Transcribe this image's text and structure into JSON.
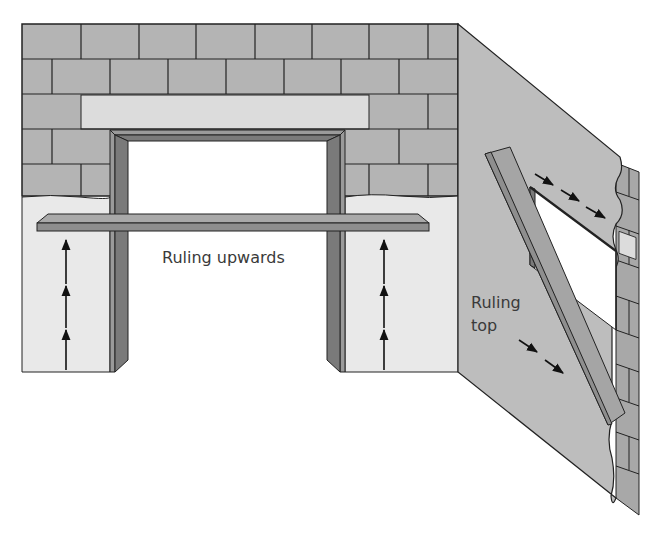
{
  "diagram": {
    "labels": {
      "ruling_upwards": "Ruling upwards",
      "ruling_top_line1": "Ruling",
      "ruling_top_line2": "top"
    },
    "colors": {
      "brick": "#b4b4b4",
      "lintel": "#dcdcdc",
      "plaster": "#e9e9e9",
      "side_wall": "#bdbdbd",
      "frame": "#7a7a7a",
      "ruler_top": "#a9a9a9",
      "ruler_side": "#8e8e8e",
      "outline": "#222222",
      "opening": "#ffffff"
    },
    "elements": [
      {
        "name": "front-wall",
        "description": "Concrete block wall with door opening"
      },
      {
        "name": "side-wall",
        "description": "Plastered wall in perspective with window opening"
      },
      {
        "name": "horizontal-ruler",
        "description": "Straight edge across opening"
      },
      {
        "name": "diagonal-ruler",
        "description": "Straight edge leaning on side wall"
      },
      {
        "name": "upward-arrows-left",
        "count": 3
      },
      {
        "name": "upward-arrows-right",
        "count": 3
      },
      {
        "name": "diagonal-arrows-top",
        "count": 3
      },
      {
        "name": "diagonal-arrows-bottom",
        "count": 2
      }
    ]
  }
}
